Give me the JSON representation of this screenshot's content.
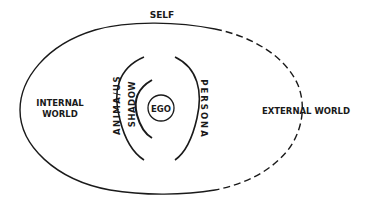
{
  "diagram": {
    "colors": {
      "line": "#1a1a1a",
      "background": "#ffffff"
    },
    "labels": {
      "self": "SELF",
      "internal_world_line1": "INTERNAL",
      "internal_world_line2": "WORLD",
      "external_world": "EXTERNAL WORLD",
      "ego": "EGO",
      "shadow": "SHADOW",
      "anima_animus": "ANIMA/US",
      "persona": "PERSONA"
    },
    "shapes": {
      "self_boundary": {
        "type": "ellipse",
        "solid_side": "left (internal)",
        "dashed_side": "right (external)"
      },
      "ego": {
        "type": "circle"
      },
      "shadow_arc": {
        "type": "arc",
        "opens": "right"
      },
      "anima_animus_arc": {
        "type": "arc",
        "opens": "right"
      },
      "persona_arc": {
        "type": "arc",
        "opens": "left"
      }
    }
  }
}
